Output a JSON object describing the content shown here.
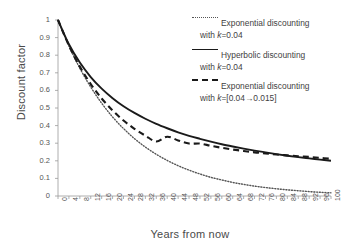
{
  "chart_data": {
    "type": "line",
    "title": "",
    "xlabel": "Years from now",
    "ylabel": "Discount factor",
    "xlim": [
      0,
      100
    ],
    "ylim": [
      0,
      1
    ],
    "grid": false,
    "legend_position": "top-right",
    "xticks": [
      0,
      4,
      8,
      12,
      16,
      20,
      24,
      28,
      32,
      36,
      40,
      44,
      48,
      52,
      56,
      60,
      64,
      68,
      72,
      76,
      80,
      84,
      88,
      92,
      96,
      100
    ],
    "yticks": [
      0,
      0.1,
      0.2,
      0.3,
      0.4,
      0.5,
      0.6,
      0.7,
      0.8,
      0.9,
      1
    ],
    "x": [
      0,
      4,
      8,
      12,
      16,
      20,
      24,
      28,
      32,
      36,
      40,
      44,
      48,
      52,
      56,
      60,
      64,
      68,
      72,
      76,
      80,
      84,
      88,
      92,
      96,
      100
    ],
    "series": [
      {
        "name": "Exponential discounting with k=0.04",
        "style": "dotted",
        "color": "#555555",
        "values": [
          1.0,
          0.852,
          0.726,
          0.619,
          0.527,
          0.449,
          0.383,
          0.326,
          0.278,
          0.237,
          0.202,
          0.172,
          0.147,
          0.125,
          0.106,
          0.091,
          0.077,
          0.066,
          0.056,
          0.048,
          0.041,
          0.035,
          0.03,
          0.025,
          0.021,
          0.018
        ]
      },
      {
        "name": "Hyperbolic discounting with k=0.04",
        "style": "solid",
        "color": "#1a1a1a",
        "values": [
          1.0,
          0.862,
          0.758,
          0.676,
          0.61,
          0.556,
          0.51,
          0.472,
          0.439,
          0.41,
          0.385,
          0.362,
          0.342,
          0.325,
          0.309,
          0.294,
          0.281,
          0.269,
          0.258,
          0.248,
          0.238,
          0.229,
          0.221,
          0.214,
          0.207,
          0.2
        ]
      },
      {
        "name": "Exponential discounting with k=[0.04->0.015]",
        "style": "dashed",
        "color": "#1a1a1a",
        "values": [
          1.0,
          0.855,
          0.735,
          0.636,
          0.554,
          0.486,
          0.429,
          0.382,
          0.343,
          0.31,
          0.337,
          0.316,
          0.298,
          0.298,
          0.285,
          0.274,
          0.264,
          0.256,
          0.248,
          0.242,
          0.236,
          0.231,
          0.226,
          0.222,
          0.217,
          0.211
        ]
      }
    ]
  },
  "axis": {
    "ylabel": "Discount factor",
    "xlabel": "Years from now",
    "ytick_labels": [
      "1",
      "0.9",
      "0.8",
      "0.7",
      "0.6",
      "0.5",
      "0.4",
      "0.3",
      "0.2",
      "0.1",
      "0"
    ],
    "xtick_labels": [
      "0",
      "4",
      "8",
      "12",
      "16",
      "20",
      "24",
      "28",
      "32",
      "36",
      "40",
      "44",
      "48",
      "52",
      "56",
      "60",
      "64",
      "68",
      "72",
      "76",
      "80",
      "84",
      "88",
      "92",
      "96",
      "100"
    ]
  },
  "legend": {
    "entries": [
      {
        "style": "dotted",
        "line1": "Exponential discounting",
        "line2_prefix": "with ",
        "line2_k": "k",
        "line2_rest": "=0.04"
      },
      {
        "style": "solid",
        "line1": "Hyperbolic discounting",
        "line2_prefix": "with ",
        "line2_k": "k",
        "line2_rest": "=0.04"
      },
      {
        "style": "dashed",
        "line1": "Exponential discounting",
        "line2_prefix": "with ",
        "line2_k": "k",
        "line2_rest": "=[0.04→0.015]"
      }
    ]
  },
  "colors": {
    "axis": "#9a9a9a",
    "solid_curve": "#1a1a1a",
    "dotted_curve": "#555555",
    "dashed_curve": "#1a1a1a",
    "text": "#3f3f3f"
  }
}
